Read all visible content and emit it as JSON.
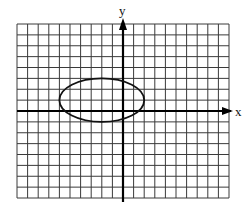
{
  "chart_data": {
    "type": "line",
    "title": "",
    "xlabel": "x",
    "ylabel": "y",
    "xlim": [
      -10,
      10
    ],
    "ylim": [
      -8,
      8
    ],
    "grid": true,
    "grid_step": 1,
    "tick_labels": false,
    "legend": null,
    "series": [
      {
        "name": "ellipse",
        "shape": "ellipse",
        "center": {
          "x": -2,
          "y": 1
        },
        "semi_axis_x": 4,
        "semi_axis_y": 2,
        "equation": "(x+2)^2/16 + (y-1)^2/4 = 1",
        "extremes": {
          "left": [
            -6,
            1
          ],
          "right": [
            2,
            1
          ],
          "top": [
            -2,
            3
          ],
          "bottom": [
            -2,
            -1
          ]
        }
      }
    ]
  },
  "colors": {
    "grid": "#3a3a3a",
    "axes": "#000000",
    "curve": "#111111",
    "background": "#ffffff"
  },
  "labels": {
    "x_axis": "x",
    "y_axis": "y"
  }
}
